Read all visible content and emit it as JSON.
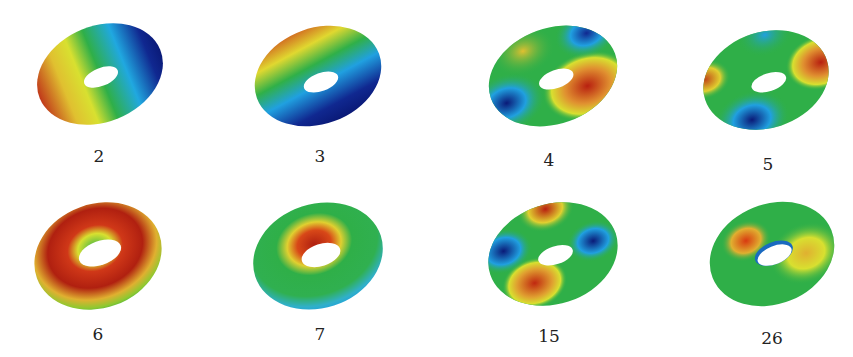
{
  "figure": {
    "colormap": [
      "#00107a",
      "#1aa0e6",
      "#2db34a",
      "#e6e62a",
      "#d83a10",
      "#a01808"
    ],
    "panels": [
      {
        "label": "2",
        "pattern": "2"
      },
      {
        "label": "3",
        "pattern": "3"
      },
      {
        "label": "4",
        "pattern": "4"
      },
      {
        "label": "5",
        "pattern": "5"
      },
      {
        "label": "6",
        "pattern": "6"
      },
      {
        "label": "7",
        "pattern": "7"
      },
      {
        "label": "15",
        "pattern": "15"
      },
      {
        "label": "26",
        "pattern": "26"
      }
    ]
  }
}
